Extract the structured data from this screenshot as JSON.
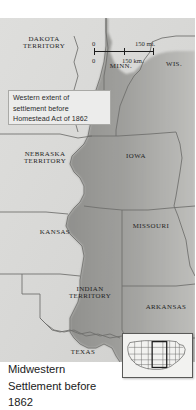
{
  "figure": {
    "caption_lines": [
      "Midwestern",
      "Settlement before",
      "1862"
    ]
  },
  "map": {
    "background_color": "#d9d9d7",
    "settled_color": "#8d8d8a",
    "border_color": "#6e6e6b",
    "annotation": {
      "lines": [
        "Western extent of",
        "settlement before",
        "Homestead Act of 1862"
      ]
    },
    "scale_bar": {
      "miles_zero": "0",
      "miles_value": "150 mi.",
      "km_zero": "0",
      "km_value": "150 km."
    },
    "places": [
      {
        "name": "dakota-territory",
        "lines": [
          "DAKOTA",
          "TERRITORY"
        ],
        "x": 44,
        "y": 40
      },
      {
        "name": "minnesota",
        "lines": [
          "MINN."
        ],
        "x": 121,
        "y": 62
      },
      {
        "name": "wisconsin",
        "lines": [
          "WIS."
        ],
        "x": 174,
        "y": 60
      },
      {
        "name": "nebraska-territory",
        "lines": [
          "NEBRASKA",
          "TERRITORY"
        ],
        "x": 45,
        "y": 155
      },
      {
        "name": "iowa",
        "lines": [
          "IOWA"
        ],
        "x": 136,
        "y": 152
      },
      {
        "name": "kansas",
        "lines": [
          "KANSAS"
        ],
        "x": 55,
        "y": 228
      },
      {
        "name": "missouri",
        "lines": [
          "MISSOURI"
        ],
        "x": 151,
        "y": 222
      },
      {
        "name": "indian-territory",
        "lines": [
          "INDIAN",
          "TERRITORY"
        ],
        "x": 90,
        "y": 290
      },
      {
        "name": "arkansas",
        "lines": [
          "ARKANSAS"
        ],
        "x": 166,
        "y": 303
      },
      {
        "name": "texas",
        "lines": [
          "TEXAS"
        ],
        "x": 83,
        "y": 348
      }
    ]
  },
  "inset": {
    "name": "united-states-locator-map",
    "highlight_label": ""
  }
}
